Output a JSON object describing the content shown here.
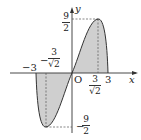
{
  "diagram": {
    "function": "y = x*sqrt(9 - x^2)",
    "axes": {
      "x_label": "x",
      "y_label": "y",
      "origin_label": "O"
    },
    "x_ticks": {
      "neg3": "−3",
      "pos3": "3",
      "neg_crit_num": "3",
      "neg_crit_den": "√2",
      "neg_crit_sign": "−",
      "pos_crit_num": "3",
      "pos_crit_den": "√2"
    },
    "y_ticks": {
      "max_num": "9",
      "max_den": "2",
      "min_sign": "−",
      "min_num": "9",
      "min_den": "2"
    },
    "colors": {
      "fill": "#cfcfcf",
      "curve": "#333333",
      "axis": "#333333",
      "dash": "#555555"
    }
  }
}
